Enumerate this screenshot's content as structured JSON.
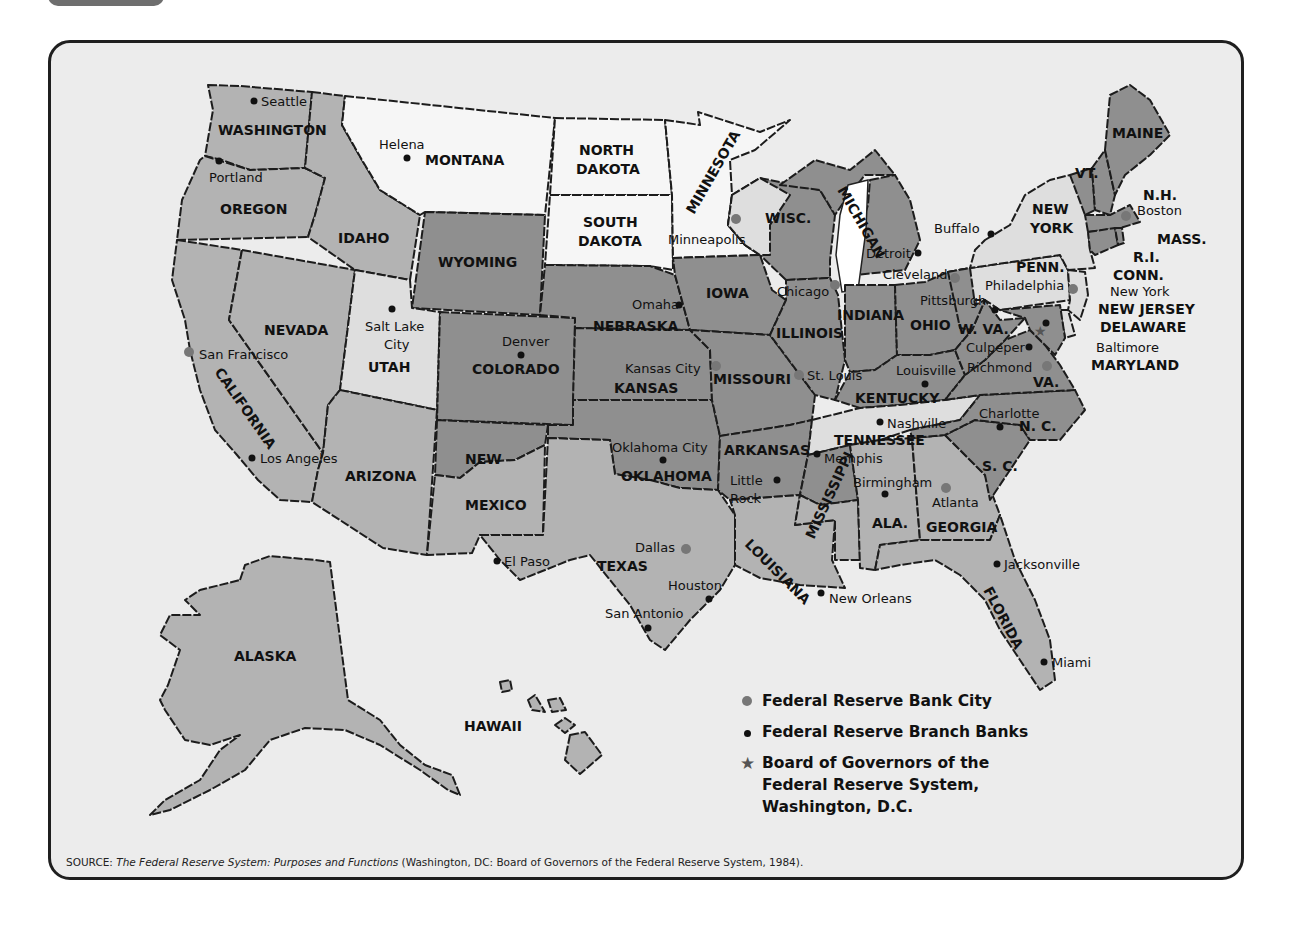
{
  "figure": {
    "legend": [
      {
        "symbol": "reserve-bank-dot",
        "label": "Federal Reserve Bank City",
        "color": "#777777"
      },
      {
        "symbol": "branch-bank-dot",
        "label": "Federal Reserve Branch Banks",
        "color": "#111111"
      },
      {
        "symbol": "star",
        "label_lines": [
          "Board of Governors of the",
          "Federal Reserve System,",
          "Washington, D.C."
        ],
        "color": "#555555"
      }
    ],
    "source": {
      "prefix": "SOURCE: ",
      "title": "The Federal Reserve System: Purposes and Functions",
      "suffix": " (Washington, DC: Board of Governors of the Federal Reserve System, 1984)."
    },
    "bottom_text": "D  . . .  F . d . . .  r . . . . . . . . .  t . . .  . .  . . . . . . . t . . d . l . b . . . . . . . f . h .  C . . . . . . . .  . . . . . . .  f . h ."
  },
  "states": [
    {
      "name": "WASHINGTON",
      "shade": "mid"
    },
    {
      "name": "OREGON",
      "shade": "mid"
    },
    {
      "name": "CALIFORNIA",
      "shade": "mid"
    },
    {
      "name": "NEVADA",
      "shade": "mid"
    },
    {
      "name": "IDAHO",
      "shade": "mid"
    },
    {
      "name": "UTAH",
      "shade": "light"
    },
    {
      "name": "ARIZONA",
      "shade": "mid"
    },
    {
      "name": "MONTANA",
      "shade": "white"
    },
    {
      "name": "WYOMING",
      "shade": "dark"
    },
    {
      "name": "COLORADO",
      "shade": "dark"
    },
    {
      "name": "NEW MEXICO",
      "shade": "mid"
    },
    {
      "name": "NORTH DAKOTA",
      "shade": "white"
    },
    {
      "name": "SOUTH DAKOTA",
      "shade": "white"
    },
    {
      "name": "NEBRASKA",
      "shade": "dark"
    },
    {
      "name": "KANSAS",
      "shade": "dark"
    },
    {
      "name": "OKLAHOMA",
      "shade": "dark"
    },
    {
      "name": "TEXAS",
      "shade": "mid"
    },
    {
      "name": "MINNESOTA",
      "shade": "white"
    },
    {
      "name": "IOWA",
      "shade": "dark"
    },
    {
      "name": "MISSOURI",
      "shade": "dark"
    },
    {
      "name": "ARKANSAS",
      "shade": "dark"
    },
    {
      "name": "LOUISIANA",
      "shade": "mid"
    },
    {
      "name": "WISC.",
      "shade": "dark"
    },
    {
      "name": "ILLINOIS",
      "shade": "dark"
    },
    {
      "name": "MICHIGAN",
      "shade": "dark"
    },
    {
      "name": "INDIANA",
      "shade": "dark"
    },
    {
      "name": "OHIO",
      "shade": "dark"
    },
    {
      "name": "KENTUCKY",
      "shade": "dark"
    },
    {
      "name": "TENNESSEE",
      "shade": "light"
    },
    {
      "name": "MISSISSIPPI",
      "shade": "dark"
    },
    {
      "name": "ALA.",
      "shade": "mid"
    },
    {
      "name": "GEORGIA",
      "shade": "mid"
    },
    {
      "name": "FLORIDA",
      "shade": "mid"
    },
    {
      "name": "S. C.",
      "shade": "dark"
    },
    {
      "name": "N. C.",
      "shade": "dark"
    },
    {
      "name": "VA.",
      "shade": "dark"
    },
    {
      "name": "W. VA.",
      "shade": "dark"
    },
    {
      "name": "PENN.",
      "shade": "light"
    },
    {
      "name": "NEW YORK",
      "shade": "light"
    },
    {
      "name": "NEW JERSEY",
      "shade": "light"
    },
    {
      "name": "DELAWARE",
      "shade": "light"
    },
    {
      "name": "MARYLAND",
      "shade": "dark"
    },
    {
      "name": "VT.",
      "shade": "dark"
    },
    {
      "name": "N.H.",
      "shade": "dark"
    },
    {
      "name": "MAINE",
      "shade": "dark"
    },
    {
      "name": "MASS.",
      "shade": "dark"
    },
    {
      "name": "R.I.",
      "shade": "dark"
    },
    {
      "name": "CONN.",
      "shade": "dark"
    },
    {
      "name": "ALASKA",
      "shade": "mid"
    },
    {
      "name": "HAWAII",
      "shade": "mid"
    }
  ],
  "labels": {
    "WASHINGTON": "WASHINGTON",
    "OREGON": "OREGON",
    "CALIFORNIA": "CALIFORNIA",
    "NEVADA": "NEVADA",
    "IDAHO": "IDAHO",
    "UTAH": "UTAH",
    "ARIZONA": "ARIZONA",
    "MONTANA": "MONTANA",
    "WYOMING": "WYOMING",
    "COLORADO": "COLORADO",
    "NEW": "NEW",
    "MEXICO": "MEXICO",
    "NORTH": "NORTH",
    "DAKOTA": "DAKOTA",
    "SOUTH": "SOUTH",
    "NEBRASKA": "NEBRASKA",
    "KANSAS": "KANSAS",
    "OKLAHOMA": "OKLAHOMA",
    "TEXAS": "TEXAS",
    "MINNESOTA": "MINNESOTA",
    "IOWA": "IOWA",
    "MISSOURI": "MISSOURI",
    "ARKANSAS": "ARKANSAS",
    "LOUISIANA": "LOUISIANA",
    "WISC": "WISC.",
    "ILLINOIS": "ILLINOIS",
    "MICHIGAN": "MICHIGAN",
    "INDIANA": "INDIANA",
    "OHIO": "OHIO",
    "KENTUCKY": "KENTUCKY",
    "TENNESSEE": "TENNESSEE",
    "MISSISSIPPI": "MISSISSIPPI",
    "ALA": "ALA.",
    "GEORGIA": "GEORGIA",
    "FLORIDA": "FLORIDA",
    "SC": "S. C.",
    "NC": "N. C.",
    "VA": "VA.",
    "WVA": "W. VA.",
    "PENN": "PENN.",
    "YORK": "YORK",
    "NEWJERSEY": "NEW JERSEY",
    "DELAWARE": "DELAWARE",
    "MARYLAND": "MARYLAND",
    "VT": "VT.",
    "NH": "N.H.",
    "MAINE": "MAINE",
    "MASS": "MASS.",
    "RI": "R.I.",
    "CONN": "CONN.",
    "ALASKA": "ALASKA",
    "HAWAII": "HAWAII"
  },
  "cities": {
    "reserve_banks": [
      {
        "name": "San Francisco"
      },
      {
        "name": "Minneapolis"
      },
      {
        "name": "Kansas City"
      },
      {
        "name": "Dallas"
      },
      {
        "name": "Chicago"
      },
      {
        "name": "St. Louis"
      },
      {
        "name": "Cleveland"
      },
      {
        "name": "Atlanta"
      },
      {
        "name": "Richmond"
      },
      {
        "name": "Philadelphia"
      },
      {
        "name": "New York"
      },
      {
        "name": "Boston"
      }
    ],
    "branch_banks": [
      {
        "name": "Seattle"
      },
      {
        "name": "Portland"
      },
      {
        "name": "Helena"
      },
      {
        "name": "Salt Lake City"
      },
      {
        "name": "Los Angeles"
      },
      {
        "name": "Denver"
      },
      {
        "name": "Omaha"
      },
      {
        "name": "Oklahoma City"
      },
      {
        "name": "El Paso"
      },
      {
        "name": "Houston"
      },
      {
        "name": "San Antonio"
      },
      {
        "name": "Little Rock"
      },
      {
        "name": "Memphis"
      },
      {
        "name": "Louisville"
      },
      {
        "name": "Nashville"
      },
      {
        "name": "Birmingham"
      },
      {
        "name": "New Orleans"
      },
      {
        "name": "Jacksonville"
      },
      {
        "name": "Miami"
      },
      {
        "name": "Charlotte"
      },
      {
        "name": "Detroit"
      },
      {
        "name": "Pittsburgh"
      },
      {
        "name": "Buffalo"
      },
      {
        "name": "Culpeper"
      },
      {
        "name": "Baltimore"
      }
    ],
    "board_of_governors": {
      "name": "Washington, D.C."
    }
  },
  "city_labels": {
    "seattle": "Seattle",
    "portland": "Portland",
    "helena": "Helena",
    "sanfrancisco": "San Francisco",
    "saltlake1": "Salt Lake",
    "saltlake2": "City",
    "losangeles": "Los Angeles",
    "denver": "Denver",
    "omaha": "Omaha",
    "kansascity": "Kansas City",
    "minneapolis": "Minneapolis",
    "chicago": "Chicago",
    "stlouis": "St. Louis",
    "detroit": "Detroit",
    "cleveland": "Cleveland",
    "pittsburgh": "Pittsburgh",
    "buffalo": "Buffalo",
    "boston": "Boston",
    "newyork": "New York",
    "philadelphia": "Philadelphia",
    "baltimore": "Baltimore",
    "culpeper": "Culpeper",
    "richmond": "Richmond",
    "louisville": "Louisville",
    "nashville": "Nashville",
    "charlotte": "Charlotte",
    "memphis": "Memphis",
    "littlerock1": "Little",
    "littlerock2": "Rock",
    "oklahomacity": "Oklahoma City",
    "dallas": "Dallas",
    "elpaso": "El Paso",
    "houston": "Houston",
    "sanantonio": "San Antonio",
    "neworleans": "New Orleans",
    "birmingham": "Birmingham",
    "atlanta": "Atlanta",
    "jacksonville": "Jacksonville",
    "miami": "Miami"
  },
  "colors": {
    "frame_border": "#1f1f1f",
    "frame_background": "#ececec",
    "shade_dark": "#8f8f8f",
    "shade_mid": "#b3b3b3",
    "shade_light": "#dedede",
    "shade_white": "#f6f6f6",
    "reserve_dot": "#777777",
    "branch_dot": "#111111"
  }
}
